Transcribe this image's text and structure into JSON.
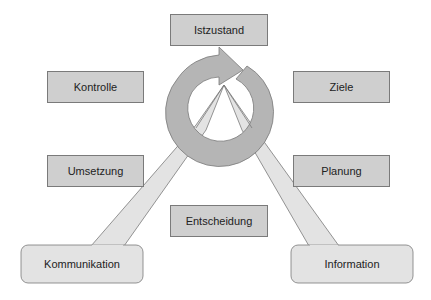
{
  "diagram": {
    "center_icon": "cycle-arrow-icon",
    "steps": [
      {
        "id": "istzustand",
        "label": "Istzustand"
      },
      {
        "id": "ziele",
        "label": "Ziele"
      },
      {
        "id": "planung",
        "label": "Planung"
      },
      {
        "id": "entscheidung",
        "label": "Entscheidung"
      },
      {
        "id": "umsetzung",
        "label": "Umsetzung"
      },
      {
        "id": "kontrolle",
        "label": "Kontrolle"
      }
    ],
    "callouts": [
      {
        "id": "kommunikation",
        "label": "Kommunikation"
      },
      {
        "id": "information",
        "label": "Information"
      }
    ],
    "colors": {
      "box_fill": "#cfcfcf",
      "ring_fill": "#b5b5b5",
      "callout_fill": "#e3e3e3",
      "stroke": "#7a7a7a"
    }
  }
}
